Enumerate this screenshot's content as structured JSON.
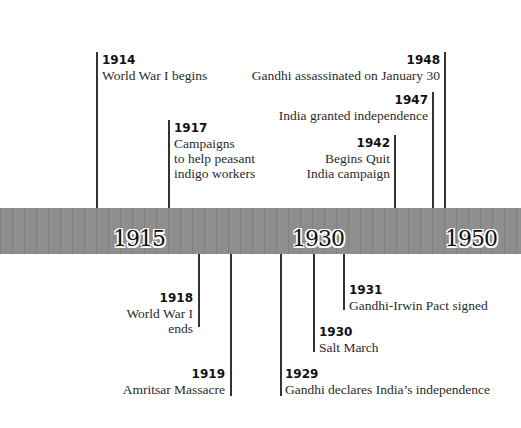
{
  "timeline": {
    "axis_labels": [
      {
        "label": "1915"
      },
      {
        "label": "1930"
      },
      {
        "label": "1950"
      }
    ],
    "events_above": [
      {
        "year": "1914",
        "text": "World War I begins"
      },
      {
        "year": "1917",
        "text": "Campaigns\nto help peasant\nindigo workers"
      },
      {
        "year": "1942",
        "text": "Begins Quit\nIndia campaign"
      },
      {
        "year": "1947",
        "text": "India granted independence"
      },
      {
        "year": "1948",
        "text": "Gandhi assassinated on January 30"
      }
    ],
    "events_below": [
      {
        "year": "1918",
        "text": "World War I\nends"
      },
      {
        "year": "1919",
        "text": "Amritsar Massacre"
      },
      {
        "year": "1929",
        "text": "Gandhi declares India’s independence"
      },
      {
        "year": "1930",
        "text": "Salt March"
      },
      {
        "year": "1931",
        "text": "Gandhi-Irwin Pact signed"
      }
    ],
    "colors": {
      "bar": "#8e8e8e",
      "line": "#333333",
      "text": "#2b2b2b"
    }
  }
}
